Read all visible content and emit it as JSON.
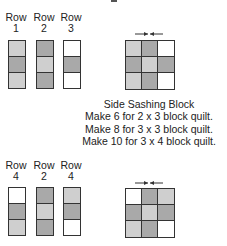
{
  "colors": {
    "light": "#cfcfcf",
    "dark": "#a9a9a9",
    "white": "#ffffff",
    "line": "#333333"
  },
  "top_section": {
    "row_labels": [
      {
        "word": "Row",
        "number": "1"
      },
      {
        "word": "Row",
        "number": "2"
      },
      {
        "word": "Row",
        "number": "3"
      }
    ],
    "strips": [
      [
        "light",
        "dark",
        "light"
      ],
      [
        "dark",
        "light",
        "dark"
      ],
      [
        "white",
        "dark",
        "white"
      ]
    ],
    "block": [
      [
        "light",
        "dark",
        "white"
      ],
      [
        "dark",
        "light",
        "dark"
      ],
      [
        "light",
        "dark",
        "white"
      ]
    ]
  },
  "caption": {
    "title": "Side Sashing Block",
    "lines": [
      "Make 6 for 2 x 3 block quilt.",
      "Make 8 for 3 x 3 block quilt.",
      "Make 10 for 3 x 4 block quilt."
    ]
  },
  "bottom_section": {
    "row_labels": [
      {
        "word": "Row",
        "number": "4"
      },
      {
        "word": "Row",
        "number": "2"
      },
      {
        "word": "Row",
        "number": "4"
      }
    ],
    "strips": [
      [
        "white",
        "dark",
        "light"
      ],
      [
        "dark",
        "light",
        "dark"
      ],
      [
        "light",
        "dark",
        "white"
      ]
    ],
    "block": [
      [
        "white",
        "dark",
        "light"
      ],
      [
        "dark",
        "light",
        "dark"
      ],
      [
        "light",
        "dark",
        "white"
      ]
    ]
  },
  "press_arrows": {
    "icon": "press-arrows-icon",
    "direction": "toward-center"
  }
}
